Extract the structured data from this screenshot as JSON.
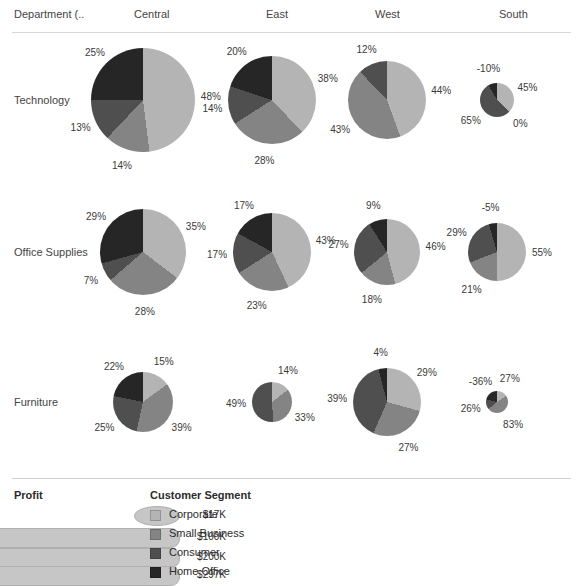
{
  "header": {
    "corner_label": "Department (..",
    "columns": [
      "Central",
      "East",
      "West",
      "South"
    ]
  },
  "rows": [
    "Technology",
    "Office Supplies",
    "Furniture"
  ],
  "legend": {
    "size_title": "Profit",
    "size_items": [
      {
        "value": "$17K"
      },
      {
        "value": "$100K"
      },
      {
        "value": "$200K"
      },
      {
        "value": "$297K"
      }
    ],
    "color_title": "Customer Segment",
    "color_items": [
      {
        "label": "Corporate",
        "color": "#b4b4b4"
      },
      {
        "label": "Small Business",
        "color": "#848484"
      },
      {
        "label": "Consumer",
        "color": "#4f4f4f"
      },
      {
        "label": "Home Office",
        "color": "#262626"
      }
    ]
  },
  "chart_data": {
    "type": "pie",
    "title": "",
    "row_field": "Department (..",
    "column_field": "Region",
    "size_encoding": "Profit",
    "color_encoding": "Customer Segment",
    "categories": [
      "Corporate",
      "Small Business",
      "Consumer",
      "Home Office"
    ],
    "colors": [
      "#b4b4b4",
      "#848484",
      "#4f4f4f",
      "#262626"
    ],
    "rows": [
      "Technology",
      "Office Supplies",
      "Furniture"
    ],
    "columns": [
      "Central",
      "East",
      "West",
      "South"
    ],
    "cells": [
      {
        "row": "Technology",
        "column": "Central",
        "labels": [
          "48%",
          "14%",
          "13%",
          "25%"
        ],
        "values": [
          48,
          14,
          13,
          25
        ]
      },
      {
        "row": "Technology",
        "column": "East",
        "labels": [
          "38%",
          "28%",
          "14%",
          "20%"
        ],
        "values": [
          38,
          28,
          14,
          20
        ]
      },
      {
        "row": "Technology",
        "column": "West",
        "labels": [
          "44%",
          "43%",
          "12%"
        ],
        "values": [
          44,
          43,
          12
        ]
      },
      {
        "row": "Technology",
        "column": "South",
        "labels": [
          "45%",
          "0%",
          "65%",
          "-10%"
        ],
        "values": [
          45,
          0,
          65,
          -10
        ]
      },
      {
        "row": "Office Supplies",
        "column": "Central",
        "labels": [
          "35%",
          "28%",
          "7%",
          "29%"
        ],
        "values": [
          35,
          28,
          7,
          29
        ]
      },
      {
        "row": "Office Supplies",
        "column": "East",
        "labels": [
          "43%",
          "23%",
          "17%",
          "17%"
        ],
        "values": [
          43,
          23,
          17,
          17
        ]
      },
      {
        "row": "Office Supplies",
        "column": "West",
        "labels": [
          "46%",
          "18%",
          "27%",
          "9%"
        ],
        "values": [
          46,
          18,
          27,
          9
        ]
      },
      {
        "row": "Office Supplies",
        "column": "South",
        "labels": [
          "55%",
          "21%",
          "29%",
          "-5%"
        ],
        "values": [
          55,
          21,
          29,
          -5
        ]
      },
      {
        "row": "Furniture",
        "column": "Central",
        "labels": [
          "15%",
          "39%",
          "25%",
          "22%"
        ],
        "values": [
          15,
          39,
          25,
          22
        ]
      },
      {
        "row": "Furniture",
        "column": "East",
        "labels": [
          "14%",
          "33%",
          "49%"
        ],
        "values": [
          14,
          33,
          49
        ]
      },
      {
        "row": "Furniture",
        "column": "West",
        "labels": [
          "29%",
          "27%",
          "39%",
          "4%"
        ],
        "values": [
          29,
          27,
          39,
          4
        ]
      },
      {
        "row": "Furniture",
        "column": "South",
        "labels": [
          "27%",
          "83%",
          "26%",
          "-36%"
        ],
        "values": [
          27,
          83,
          26,
          -36
        ]
      }
    ]
  }
}
